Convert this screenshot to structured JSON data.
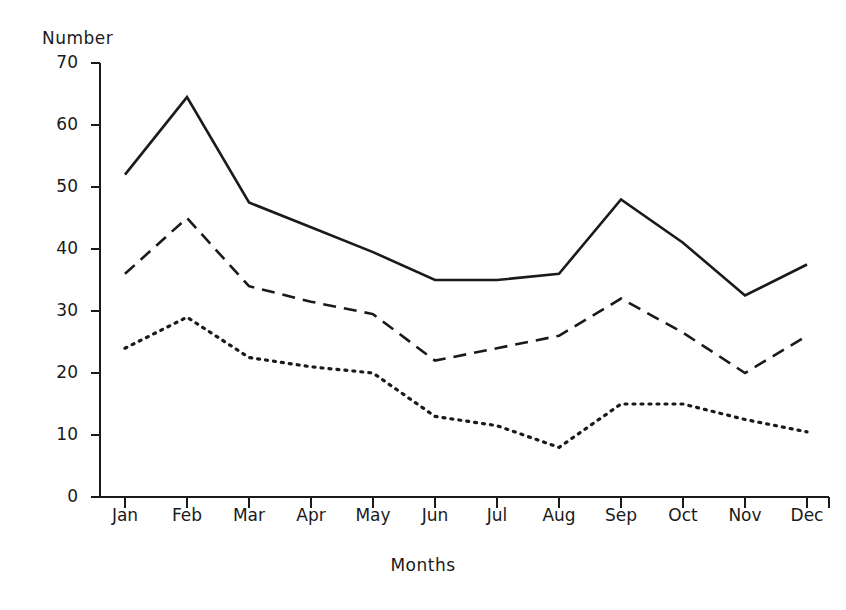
{
  "chart_data": {
    "type": "line",
    "title": "",
    "xlabel": "Months",
    "ylabel": "Number",
    "categories": [
      "Jan",
      "Feb",
      "Mar",
      "Apr",
      "May",
      "Jun",
      "Jul",
      "Aug",
      "Sep",
      "Oct",
      "Nov",
      "Dec"
    ],
    "xlim": [
      0,
      11
    ],
    "ylim": [
      0,
      70
    ],
    "yticks": [
      0,
      10,
      20,
      30,
      40,
      50,
      60,
      70
    ],
    "grid": false,
    "legend": "none",
    "series": [
      {
        "name": "solid-series",
        "style": "solid",
        "color": "#1a1a1a",
        "values": [
          52,
          64.5,
          47.5,
          43.5,
          39.5,
          35,
          35,
          36,
          48,
          41,
          32.5,
          37.5
        ]
      },
      {
        "name": "dashed-series",
        "style": "dashed",
        "color": "#1a1a1a",
        "values": [
          36,
          45,
          34,
          31.5,
          29.5,
          22,
          24,
          26,
          32,
          26.5,
          20,
          26
        ]
      },
      {
        "name": "dotted-series",
        "style": "dotted",
        "color": "#1a1a1a",
        "values": [
          24,
          29,
          22.5,
          21,
          20,
          13,
          11.5,
          8,
          15,
          15,
          12.5,
          10.5
        ]
      }
    ]
  },
  "axes": {
    "ylabel_text": "Number",
    "xlabel_text": "Months",
    "ytick_labels": [
      "70",
      "60",
      "50",
      "40",
      "30",
      "20",
      "10",
      "0"
    ],
    "xtick_labels": [
      "Jan",
      "Feb",
      "Mar",
      "Apr",
      "May",
      "Jun",
      "Jul",
      "Aug",
      "Sep",
      "Oct",
      "Nov",
      "Dec"
    ]
  },
  "colors": {
    "ink": "#1a1a1a",
    "background": "#ffffff"
  }
}
